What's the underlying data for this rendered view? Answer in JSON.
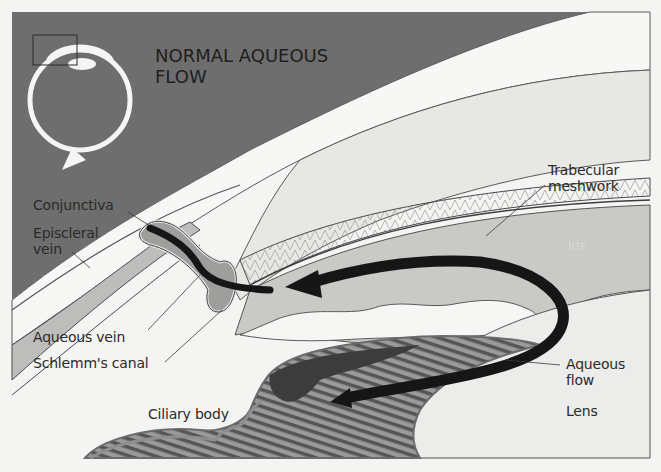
{
  "title": {
    "line1": "NORMAL AQUEOUS",
    "line2": "FLOW"
  },
  "labels": {
    "conjunctiva": "Conjunctiva",
    "episcleral_vein_1": "Episcleral",
    "episcleral_vein_2": "vein",
    "aqueous_vein": "Aqueous vein",
    "schlemms_canal": "Schlemm's canal",
    "ciliary_body": "Ciliary body",
    "trabecular_1": "Trabecular",
    "trabecular_2": "meshwork",
    "iris": "Iris",
    "aqueous_flow_1": "Aqueous",
    "aqueous_flow_2": "flow",
    "lens": "Lens"
  },
  "colors": {
    "background_dark": "#6e6e6e",
    "sclera": "#f7f7f5",
    "cornea_band": "#e6e6e3",
    "iris": "#c9c9c6",
    "flow_arrow": "#161616",
    "ciliary_dark": "#3c3c3c",
    "outline": "#4a4a4a"
  }
}
